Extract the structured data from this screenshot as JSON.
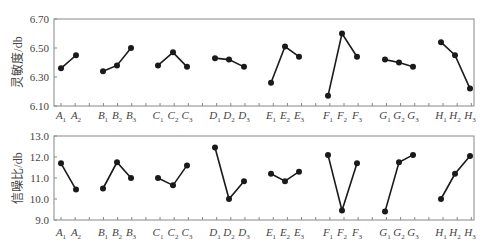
{
  "chart_data": [
    {
      "type": "line",
      "title": "",
      "xlabel": "",
      "ylabel": "灵敏度/db",
      "ylim": [
        6.1,
        6.7
      ],
      "yticks": [
        "6.10",
        "6.30",
        "6.50",
        "6.70"
      ],
      "grid": false,
      "groups": [
        {
          "factor": "A",
          "categories": [
            "A1",
            "A2"
          ],
          "values": [
            6.36,
            6.45
          ]
        },
        {
          "factor": "B",
          "categories": [
            "B1",
            "B2",
            "B3"
          ],
          "values": [
            6.34,
            6.38,
            6.5
          ]
        },
        {
          "factor": "C",
          "categories": [
            "C1",
            "C2",
            "C3"
          ],
          "values": [
            6.38,
            6.47,
            6.37
          ]
        },
        {
          "factor": "D",
          "categories": [
            "D1",
            "D2",
            "D3"
          ],
          "values": [
            6.43,
            6.42,
            6.37
          ]
        },
        {
          "factor": "E",
          "categories": [
            "E1",
            "E2",
            "E3"
          ],
          "values": [
            6.26,
            6.51,
            6.44
          ]
        },
        {
          "factor": "F",
          "categories": [
            "F1",
            "F2",
            "F3"
          ],
          "values": [
            6.17,
            6.6,
            6.44
          ]
        },
        {
          "factor": "G",
          "categories": [
            "G1",
            "G2",
            "G3"
          ],
          "values": [
            6.42,
            6.4,
            6.37
          ]
        },
        {
          "factor": "H",
          "categories": [
            "H1",
            "H2",
            "H3"
          ],
          "values": [
            6.54,
            6.45,
            6.22
          ]
        }
      ]
    },
    {
      "type": "line",
      "title": "",
      "xlabel": "",
      "ylabel": "信噪比/db",
      "ylim": [
        9.0,
        13.0
      ],
      "yticks": [
        "9.0",
        "10.0",
        "11.0",
        "12.0",
        "13.0"
      ],
      "grid": false,
      "groups": [
        {
          "factor": "A",
          "categories": [
            "A1",
            "A2"
          ],
          "values": [
            11.7,
            10.45
          ]
        },
        {
          "factor": "B",
          "categories": [
            "B1",
            "B2",
            "B3"
          ],
          "values": [
            10.5,
            11.75,
            11.0
          ]
        },
        {
          "factor": "C",
          "categories": [
            "C1",
            "C2",
            "C3"
          ],
          "values": [
            11.0,
            10.65,
            11.6
          ]
        },
        {
          "factor": "D",
          "categories": [
            "D1",
            "D2",
            "D3"
          ],
          "values": [
            12.45,
            10.0,
            10.85
          ]
        },
        {
          "factor": "E",
          "categories": [
            "E1",
            "E2",
            "E3"
          ],
          "values": [
            11.2,
            10.85,
            11.3
          ]
        },
        {
          "factor": "F",
          "categories": [
            "F1",
            "F2",
            "F3"
          ],
          "values": [
            12.1,
            9.45,
            11.7
          ]
        },
        {
          "factor": "G",
          "categories": [
            "G1",
            "G2",
            "G3"
          ],
          "values": [
            9.4,
            11.75,
            12.1
          ]
        },
        {
          "factor": "H",
          "categories": [
            "H1",
            "H2",
            "H3"
          ],
          "values": [
            10.0,
            11.2,
            12.05
          ]
        }
      ]
    }
  ],
  "style": {
    "line_color": "#1a1a1a",
    "axis_color": "#888888"
  }
}
